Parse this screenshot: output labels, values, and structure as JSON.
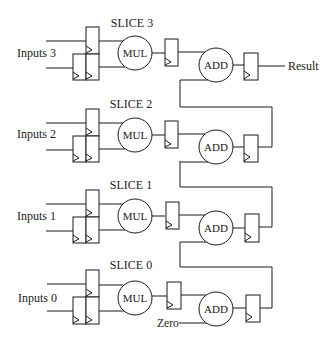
{
  "diagram": {
    "slices": [
      {
        "name": "SLICE 3",
        "input_label": "Inputs 3",
        "mul_label": "MUL",
        "add_label": "ADD"
      },
      {
        "name": "SLICE 2",
        "input_label": "Inputs 2",
        "mul_label": "MUL",
        "add_label": "ADD"
      },
      {
        "name": "SLICE 1",
        "input_label": "Inputs 1",
        "mul_label": "MUL",
        "add_label": "ADD"
      },
      {
        "name": "SLICE 0",
        "input_label": "Inputs 0",
        "mul_label": "MUL",
        "add_label": "ADD"
      }
    ],
    "result_label": "Result",
    "zero_label": "Zero",
    "colors": {
      "line": "#1a1a1a",
      "background": "#ffffff"
    }
  }
}
